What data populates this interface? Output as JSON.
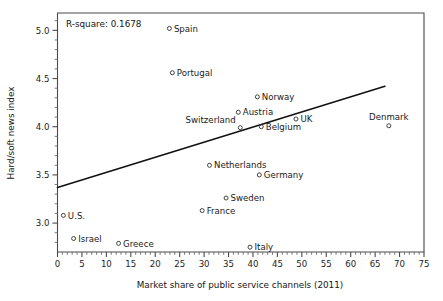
{
  "chart_data": {
    "type": "scatter",
    "title": "",
    "xlabel": "Market share of public service channels (2011)",
    "ylabel": "Hard/soft news index",
    "xlim": [
      0,
      75
    ],
    "ylim": [
      2.7,
      5.18
    ],
    "grid": false,
    "legend": "none",
    "xticks": [
      0,
      5,
      10,
      15,
      20,
      25,
      30,
      35,
      40,
      45,
      50,
      55,
      60,
      65,
      70,
      75
    ],
    "xtick_labels": [
      "0",
      "5",
      "10",
      "15",
      "20",
      "25",
      "30",
      "35",
      "40",
      "45",
      "50",
      "55",
      "60",
      "65",
      "70",
      "75"
    ],
    "yticks": [
      3.0,
      3.5,
      4.0,
      4.5,
      5.0
    ],
    "ytick_labels": [
      "3.0",
      "3.5",
      "4.0",
      "4.5",
      "5.0"
    ],
    "x_minor_interval": 1,
    "y_minor_interval": 0.1,
    "annotation": "R-square:  0.1678",
    "r_square": 0.1678,
    "marker_style": "open-circle",
    "points": [
      {
        "label": "Spain",
        "x": 22.9,
        "y": 5.02,
        "label_pos": "right"
      },
      {
        "label": "Portugal",
        "x": 23.5,
        "y": 4.56,
        "label_pos": "right"
      },
      {
        "label": "Norway",
        "x": 40.9,
        "y": 4.31,
        "label_pos": "right"
      },
      {
        "label": "Austria",
        "x": 37.0,
        "y": 4.15,
        "label_pos": "right"
      },
      {
        "label": "UK",
        "x": 48.8,
        "y": 4.08,
        "label_pos": "right"
      },
      {
        "label": "Belgium",
        "x": 41.7,
        "y": 4.0,
        "label_pos": "right"
      },
      {
        "label": "Switzerland",
        "x": 37.4,
        "y": 3.99,
        "label_pos": "above-left"
      },
      {
        "label": "Denmark",
        "x": 67.8,
        "y": 4.01,
        "label_pos": "above"
      },
      {
        "label": "Netherlands",
        "x": 31.1,
        "y": 3.6,
        "label_pos": "right"
      },
      {
        "label": "Germany",
        "x": 41.3,
        "y": 3.5,
        "label_pos": "right"
      },
      {
        "label": "Sweden",
        "x": 34.5,
        "y": 3.26,
        "label_pos": "right"
      },
      {
        "label": "France",
        "x": 29.6,
        "y": 3.13,
        "label_pos": "right"
      },
      {
        "label": "U.S.",
        "x": 1.2,
        "y": 3.08,
        "label_pos": "right"
      },
      {
        "label": "Israel",
        "x": 3.3,
        "y": 2.84,
        "label_pos": "right"
      },
      {
        "label": "Greece",
        "x": 12.5,
        "y": 2.79,
        "label_pos": "right"
      },
      {
        "label": "Italy",
        "x": 39.4,
        "y": 2.75,
        "label_pos": "right"
      }
    ],
    "fit_line": {
      "x_start": 0,
      "y_start": 3.37,
      "x_end": 67.0,
      "y_end": 4.42
    }
  }
}
